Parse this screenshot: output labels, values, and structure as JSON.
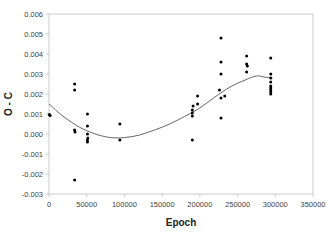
{
  "chart_data": {
    "type": "scatter",
    "title": "",
    "xlabel": "Epoch",
    "ylabel": "O - C",
    "xlim": [
      0,
      350000
    ],
    "ylim": [
      -0.003,
      0.006
    ],
    "x_ticks": [
      0,
      50000,
      100000,
      150000,
      200000,
      250000,
      300000,
      350000
    ],
    "x_tick_labels": [
      "0",
      "50000",
      "100000",
      "150000",
      "200000",
      "250000",
      "300000",
      "350000"
    ],
    "y_ticks": [
      -0.003,
      -0.002,
      -0.001,
      0.0,
      0.001,
      0.002,
      0.003,
      0.004,
      0.005,
      0.006
    ],
    "y_tick_labels": [
      "-0.003",
      "-0.002",
      "-0.001",
      "0.000",
      "0.001",
      "0.002",
      "0.003",
      "0.004",
      "0.005",
      "0.006"
    ],
    "grid": false,
    "legend": "none",
    "series": [
      {
        "name": "O-C observations",
        "kind": "scatter",
        "color": "#000000",
        "points": [
          [
            500,
            0.00097
          ],
          [
            1500,
            0.00093
          ],
          [
            34000,
            0.0025
          ],
          [
            34000,
            0.0022
          ],
          [
            34000,
            0.0002
          ],
          [
            34500,
            0.0001
          ],
          [
            34000,
            -0.0023
          ],
          [
            51000,
            0.001
          ],
          [
            51000,
            0.0004
          ],
          [
            51000,
            0.0
          ],
          [
            51500,
            -0.0002
          ],
          [
            51000,
            -0.0003
          ],
          [
            51000,
            -0.0004
          ],
          [
            94000,
            0.0005
          ],
          [
            94000,
            -0.0003
          ],
          [
            190000,
            0.0012
          ],
          [
            190000,
            0.00105
          ],
          [
            190000,
            0.0009
          ],
          [
            190000,
            -0.0003
          ],
          [
            191000,
            0.0014
          ],
          [
            197000,
            0.0019
          ],
          [
            197000,
            0.0015
          ],
          [
            226000,
            0.0022
          ],
          [
            228000,
            0.0048
          ],
          [
            228000,
            0.0036
          ],
          [
            228000,
            0.003
          ],
          [
            228000,
            0.0018
          ],
          [
            228000,
            0.0008
          ],
          [
            233000,
            0.0019
          ],
          [
            262000,
            0.0039
          ],
          [
            262000,
            0.0035
          ],
          [
            263000,
            0.0034
          ],
          [
            262000,
            0.0031
          ],
          [
            294000,
            0.0038
          ],
          [
            294000,
            0.003
          ],
          [
            294000,
            0.0028
          ],
          [
            294000,
            0.0026
          ],
          [
            294000,
            0.0024
          ],
          [
            294000,
            0.0023
          ],
          [
            294000,
            0.0022
          ],
          [
            294000,
            0.0021
          ],
          [
            294000,
            0.002
          ]
        ]
      },
      {
        "name": "Polynomial fit",
        "kind": "line",
        "color": "#555555",
        "points": [
          [
            0,
            0.0015
          ],
          [
            20000,
            0.00085
          ],
          [
            40000,
            0.00035
          ],
          [
            60000,
            2e-05
          ],
          [
            80000,
            -0.00017
          ],
          [
            100000,
            -0.00018
          ],
          [
            120000,
            -5e-05
          ],
          [
            140000,
            0.0002
          ],
          [
            160000,
            0.0005
          ],
          [
            180000,
            0.00088
          ],
          [
            200000,
            0.0013
          ],
          [
            220000,
            0.00185
          ],
          [
            240000,
            0.00235
          ],
          [
            260000,
            0.0027
          ],
          [
            275000,
            0.0029
          ],
          [
            285000,
            0.00285
          ],
          [
            296000,
            0.0028
          ]
        ]
      }
    ]
  }
}
